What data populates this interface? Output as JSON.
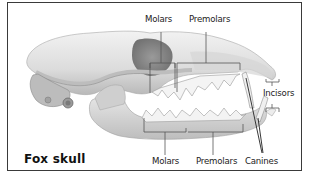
{
  "diagram": {
    "title": "Fox skull",
    "labels": {
      "upper_molars": "Molars",
      "upper_premolars": "Premolars",
      "incisors": "Incisors",
      "lower_molars": "Molars",
      "lower_premolars": "Premolars",
      "canines": "Canines"
    },
    "colors": {
      "border": "#3a3a3a",
      "bone_light": "#ececec",
      "bone_mid": "#c9c9c9",
      "bone_dark": "#8e8e8e",
      "leader_line": "#555555"
    }
  }
}
